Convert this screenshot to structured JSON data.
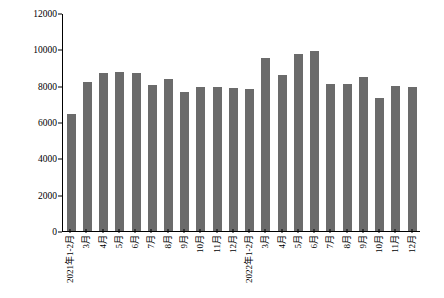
{
  "chart_data": {
    "type": "bar",
    "title": "",
    "xlabel": "",
    "ylabel": "铁矿石月产量/万吨",
    "ylim": [
      0,
      12000
    ],
    "yticks": [
      0,
      2000,
      4000,
      6000,
      8000,
      10000,
      12000
    ],
    "grid": false,
    "legend": null,
    "bar_color": "#6b6b6b",
    "categories": [
      "2021年1-2月",
      "3月",
      "4月",
      "5月",
      "6月",
      "7月",
      "8月",
      "9月",
      "10月",
      "11月",
      "12月",
      "2022年1-2月",
      "3月",
      "4月",
      "5月",
      "6月",
      "7月",
      "8月",
      "9月",
      "10月",
      "11月",
      "12月"
    ],
    "values": [
      6450,
      8200,
      8700,
      8750,
      8700,
      8050,
      8350,
      7650,
      7950,
      7900,
      7850,
      7800,
      9500,
      8600,
      9750,
      9900,
      8100,
      8100,
      8500,
      7300,
      8000,
      7900
    ]
  }
}
